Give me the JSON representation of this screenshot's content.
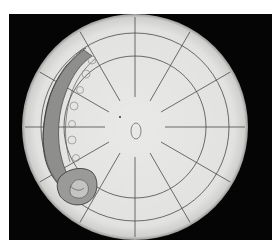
{
  "image": {
    "width": 279,
    "height": 249,
    "description": "Circular test-section shadowgraph with polar grid and a curved vortex/shock structure on the left side",
    "colors": {
      "page_bg": "#ffffff",
      "frame_bg": "#050505",
      "disc_fill": "#e6e6e4",
      "disc_edge": "#c9c9c7",
      "grid_line": "#4a4a4a",
      "vortex_fill": "#8e8e8c",
      "vortex_dark": "#5c5c5a",
      "vortex_light": "#c4c4c2"
    },
    "frame": {
      "x": 9,
      "y": 14,
      "width": 263,
      "height": 226
    },
    "disc": {
      "cx": 135,
      "cy": 127,
      "r": 113
    },
    "rings": [
      71,
      94
    ],
    "spokes": {
      "count": 12,
      "inner_radius": 30,
      "outer_radius": 110,
      "start_angle_deg": 0
    },
    "center_marker": {
      "cx": 136,
      "cy": 131,
      "rx": 5,
      "ry": 8
    },
    "dot": {
      "cx": 120,
      "cy": 117,
      "r": 1
    }
  }
}
